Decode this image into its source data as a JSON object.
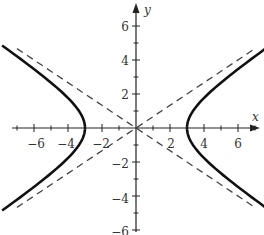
{
  "chart_data": {
    "type": "line",
    "title": "",
    "xlabel": "x",
    "ylabel": "y",
    "xlim": [
      -7,
      7
    ],
    "ylim": [
      -6,
      6
    ],
    "grid": false,
    "legend": null,
    "x_ticks": [
      -6,
      -4,
      -2,
      2,
      4,
      6
    ],
    "y_ticks": [
      -6,
      -4,
      -2,
      2,
      4,
      6
    ],
    "x_ticks_labels": [
      "−6",
      "−4",
      "−2",
      "2",
      "4",
      "6"
    ],
    "y_ticks_labels": [
      "−6",
      "−4",
      "−2",
      "2",
      "4",
      "6"
    ],
    "equation": "x^2/9 - y^2/4 = 1",
    "series": [
      {
        "name": "hyperbola-right-branch",
        "style": "solid",
        "a": 3,
        "b": 2,
        "points": [
          [
            7,
            4.22
          ],
          [
            5,
            2.67
          ],
          [
            4,
            1.76
          ],
          [
            3,
            0
          ],
          [
            4,
            -1.76
          ],
          [
            5,
            -2.67
          ],
          [
            7,
            -4.22
          ]
        ]
      },
      {
        "name": "hyperbola-left-branch",
        "style": "solid",
        "a": 3,
        "b": 2,
        "points": [
          [
            -7,
            4.22
          ],
          [
            -5,
            2.67
          ],
          [
            -4,
            1.76
          ],
          [
            -3,
            0
          ],
          [
            -4,
            -1.76
          ],
          [
            -5,
            -2.67
          ],
          [
            -7,
            -4.22
          ]
        ]
      },
      {
        "name": "asymptote-positive",
        "style": "dashed",
        "equation": "y = 2x/3",
        "points": [
          [
            -7,
            -4.67
          ],
          [
            7,
            4.67
          ]
        ]
      },
      {
        "name": "asymptote-negative",
        "style": "dashed",
        "equation": "y = -2x/3",
        "points": [
          [
            -7,
            4.67
          ],
          [
            7,
            -4.67
          ]
        ]
      }
    ],
    "colors": {
      "curve": "#111111",
      "asymptote": "#444444",
      "axis": "#222222"
    }
  },
  "labels": {
    "x_axis": "x",
    "y_axis": "y",
    "xt": [
      "−6",
      "−4",
      "−2",
      "2",
      "4",
      "6"
    ],
    "yt_pos": [
      "6",
      "4",
      "2"
    ],
    "yt_neg": [
      "−2",
      "−4",
      "−6"
    ]
  }
}
